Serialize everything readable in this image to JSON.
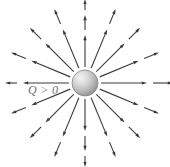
{
  "figure": {
    "background_color": "#ffffff",
    "width": 170,
    "height": 167
  },
  "charge": {
    "label": "Q > 0",
    "label_color": "#6e6e6e",
    "center_x": 85,
    "center_y": 83,
    "radius": 13,
    "fill_light": "#f2f2f2",
    "fill_mid": "#b9b9b9",
    "fill_dark": "#8d8d8d",
    "rim_color": "#7a7a7a",
    "sign": "positive"
  },
  "field": {
    "arrow_color": "#3a3a3a",
    "line_width": 1.1,
    "ray_count": 16,
    "angle_step_deg": 22.5,
    "direction": "outward",
    "rays": [
      {
        "angle_deg": 0,
        "segments": [
          [
            16,
            62
          ],
          [
            68,
            88
          ],
          [
            94,
            106
          ]
        ]
      },
      {
        "angle_deg": 22.5,
        "segments": [
          [
            16,
            58
          ],
          [
            64,
            80
          ]
        ]
      },
      {
        "angle_deg": 45,
        "segments": [
          [
            16,
            56
          ],
          [
            62,
            78
          ]
        ]
      },
      {
        "angle_deg": 67.5,
        "segments": [
          [
            16,
            58
          ],
          [
            64,
            80
          ]
        ]
      },
      {
        "angle_deg": 90,
        "segments": [
          [
            16,
            48
          ],
          [
            53,
            68
          ],
          [
            73,
            84
          ]
        ]
      },
      {
        "angle_deg": 112.5,
        "segments": [
          [
            16,
            58
          ],
          [
            64,
            80
          ]
        ]
      },
      {
        "angle_deg": 135,
        "segments": [
          [
            16,
            56
          ],
          [
            62,
            78
          ]
        ]
      },
      {
        "angle_deg": 157.5,
        "segments": [
          [
            16,
            58
          ],
          [
            64,
            80
          ]
        ]
      },
      {
        "angle_deg": 180,
        "segments": [
          [
            16,
            62
          ],
          [
            68,
            80
          ]
        ]
      },
      {
        "angle_deg": 202.5,
        "segments": [
          [
            16,
            58
          ],
          [
            64,
            80
          ]
        ]
      },
      {
        "angle_deg": 225,
        "segments": [
          [
            16,
            56
          ],
          [
            62,
            78
          ]
        ]
      },
      {
        "angle_deg": 247.5,
        "segments": [
          [
            16,
            58
          ],
          [
            64,
            80
          ]
        ]
      },
      {
        "angle_deg": 270,
        "segments": [
          [
            16,
            48
          ],
          [
            53,
            68
          ],
          [
            73,
            84
          ]
        ]
      },
      {
        "angle_deg": 292.5,
        "segments": [
          [
            16,
            58
          ],
          [
            64,
            80
          ]
        ]
      },
      {
        "angle_deg": 315,
        "segments": [
          [
            16,
            56
          ],
          [
            62,
            78
          ]
        ]
      },
      {
        "angle_deg": 337.5,
        "segments": [
          [
            16,
            58
          ],
          [
            64,
            80
          ]
        ]
      }
    ]
  },
  "chart_data": {
    "type": "diagram",
    "annotations": [
      "Q > 0"
    ]
  }
}
